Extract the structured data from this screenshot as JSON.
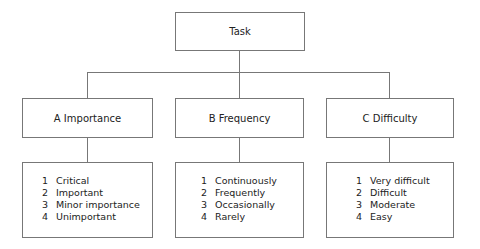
{
  "root": {
    "label": "Task"
  },
  "categories": [
    {
      "label": "A Importance",
      "items": [
        {
          "num": "1",
          "text": "Critical"
        },
        {
          "num": "2",
          "text": "Important"
        },
        {
          "num": "3",
          "text": "Minor importance"
        },
        {
          "num": "4",
          "text": "Unimportant"
        }
      ]
    },
    {
      "label": "B Frequency",
      "items": [
        {
          "num": "1",
          "text": "Continuously"
        },
        {
          "num": "2",
          "text": "Frequently"
        },
        {
          "num": "3",
          "text": "Occasionally"
        },
        {
          "num": "4",
          "text": "Rarely"
        }
      ]
    },
    {
      "label": "C Difficulty",
      "items": [
        {
          "num": "1",
          "text": "Very difficult"
        },
        {
          "num": "2",
          "text": "Difficult"
        },
        {
          "num": "3",
          "text": "Moderate"
        },
        {
          "num": "4",
          "text": "Easy"
        }
      ]
    }
  ]
}
